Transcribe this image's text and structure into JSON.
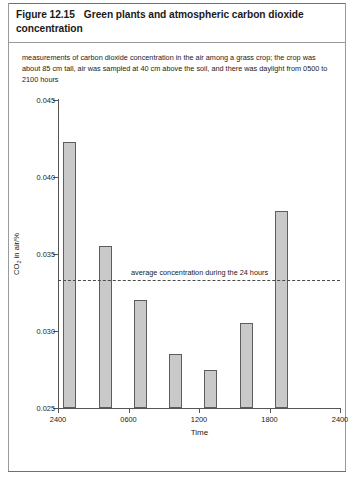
{
  "figure": {
    "number": "Figure 12.15",
    "title": "Green plants and atmospheric carbon dioxide concentration",
    "caption": "measurements of carbon dioxide concentration in the air among a grass crop; the crop was about 85 cm tall, air was sampled at 40 cm above the soil, and there was daylight from 0500 to 2100 hours"
  },
  "chart_data": {
    "type": "bar",
    "title": "Green plants and atmospheric carbon dioxide concentration",
    "xlabel": "Time",
    "ylabel": "CO2 in air/%",
    "ylabel_parts": {
      "pre": "CO",
      "sub": "2",
      "post": " in air/%"
    },
    "ylim": [
      0.025,
      0.045
    ],
    "yticks": [
      "0.025",
      "0.030",
      "0.035",
      "0.040",
      "0.045"
    ],
    "ytick_values": [
      0.025,
      0.03,
      0.035,
      0.04,
      0.045
    ],
    "xlim": [
      2400,
      4800
    ],
    "xticks": [
      "2400",
      "0600",
      "1200",
      "1800",
      "2400"
    ],
    "xtick_values": [
      2400,
      3000,
      3600,
      4200,
      4800
    ],
    "grid": false,
    "legend": false,
    "categories": [
      "0100",
      "0400",
      "0700",
      "1000",
      "1300",
      "1600",
      "1900"
    ],
    "x": [
      2500,
      2800,
      3100,
      3400,
      3700,
      4000,
      4300
    ],
    "values": [
      0.0423,
      0.0355,
      0.032,
      0.0285,
      0.0275,
      0.0305,
      0.0378
    ],
    "bar_color": "#c9c9c9",
    "bar_edge_color": "#5d5d5d",
    "annotations": [
      {
        "type": "hline",
        "label": "average concentration during the 24 hours",
        "value": 0.0333
      }
    ]
  }
}
